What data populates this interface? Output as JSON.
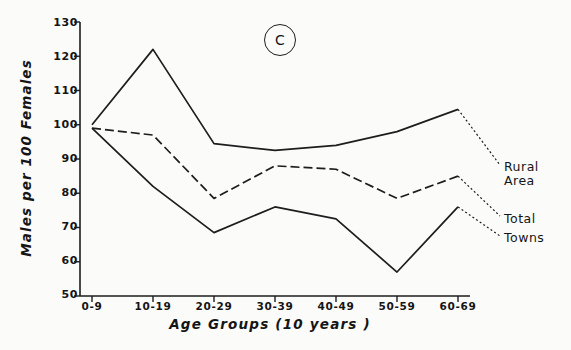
{
  "panel": {
    "tag": "C"
  },
  "axes": {
    "ylabel": "Males per 100 Females",
    "xlabel": "Age Groups  (10 years )",
    "yticks": [
      "130",
      "120",
      "110",
      "100",
      "90",
      "80",
      "70",
      "60",
      "50"
    ],
    "xticks": [
      "0-9",
      "10-19",
      "20-29",
      "30-39",
      "40-49",
      "50-59",
      "60-69"
    ]
  },
  "series_labels": {
    "rural_line1": "Rural",
    "rural_line2": "Area",
    "total": "Total",
    "towns": "Towns"
  },
  "chart_data": {
    "type": "line",
    "title": "",
    "subtitle": "",
    "panel_label": "C",
    "xlabel": "Age Groups  (10 years )",
    "ylabel": "Males per 100 Females",
    "categories": [
      "0-9",
      "10-19",
      "20-29",
      "30-39",
      "40-49",
      "50-59",
      "60-69"
    ],
    "ylim": [
      50,
      130
    ],
    "ytick_values": [
      50,
      60,
      70,
      80,
      90,
      100,
      110,
      120,
      130
    ],
    "grid": false,
    "legend": "end-of-line annotations",
    "series": [
      {
        "name": "Rural Area",
        "style": "solid",
        "color": "#1d1d1d",
        "values": [
          100,
          122,
          94.5,
          92.5,
          94,
          98,
          104.5
        ]
      },
      {
        "name": "Total",
        "style": "dashed",
        "color": "#1d1d1d",
        "values": [
          99,
          97,
          78.5,
          88,
          87,
          78.5,
          85
        ]
      },
      {
        "name": "Towns",
        "style": "solid",
        "color": "#1d1d1d",
        "values": [
          99,
          82,
          68.5,
          76,
          72.5,
          57,
          76
        ]
      }
    ]
  }
}
